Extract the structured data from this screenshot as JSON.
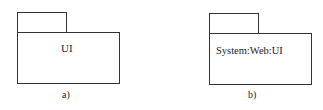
{
  "diagrams": [
    {
      "package_name": "UI",
      "caption": "a)"
    },
    {
      "package_name": "System:Web:UI",
      "caption": "b)"
    }
  ]
}
